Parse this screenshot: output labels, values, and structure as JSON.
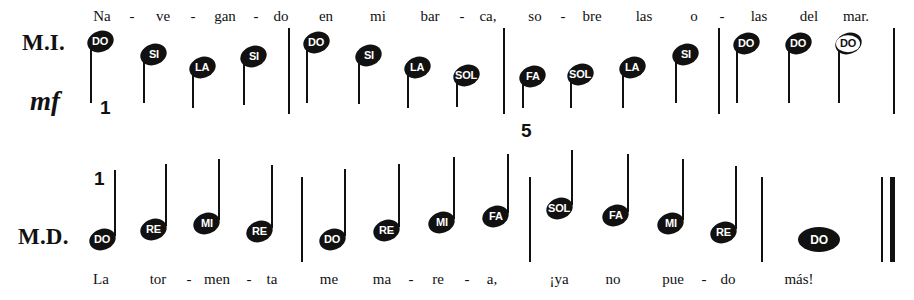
{
  "document": {
    "kind": "music-notation-exercise",
    "language": "es"
  },
  "staves": [
    {
      "id": "upper",
      "hand_label": "M.I.",
      "dynamic": "mf",
      "measure_numbers": [
        {
          "text": "1",
          "x": 100,
          "y": 97
        },
        {
          "text": "5",
          "x": 521,
          "y": 120
        }
      ],
      "lyrics": [
        {
          "text": "Na",
          "x": 102,
          "y": 8
        },
        {
          "text": "-",
          "x": 132,
          "y": 8,
          "hyphen": true
        },
        {
          "text": "ve",
          "x": 163,
          "y": 8
        },
        {
          "text": "-",
          "x": 193,
          "y": 8,
          "hyphen": true
        },
        {
          "text": "gan",
          "x": 225,
          "y": 8
        },
        {
          "text": "-",
          "x": 256,
          "y": 8,
          "hyphen": true
        },
        {
          "text": "do",
          "x": 281,
          "y": 8
        },
        {
          "text": "en",
          "x": 326,
          "y": 8
        },
        {
          "text": "mi",
          "x": 378,
          "y": 8
        },
        {
          "text": "bar",
          "x": 430,
          "y": 8
        },
        {
          "text": "-",
          "x": 462,
          "y": 8,
          "hyphen": true
        },
        {
          "text": "ca,",
          "x": 488,
          "y": 8
        },
        {
          "text": "so",
          "x": 535,
          "y": 8
        },
        {
          "text": "-",
          "x": 563,
          "y": 8,
          "hyphen": true
        },
        {
          "text": "bre",
          "x": 592,
          "y": 8
        },
        {
          "text": "las",
          "x": 644,
          "y": 8
        },
        {
          "text": "o",
          "x": 694,
          "y": 8
        },
        {
          "text": "-",
          "x": 722,
          "y": 8,
          "hyphen": true
        },
        {
          "text": "las",
          "x": 759,
          "y": 8
        },
        {
          "text": "del",
          "x": 809,
          "y": 8
        },
        {
          "text": "mar.",
          "x": 856,
          "y": 8
        }
      ],
      "barlines": [
        {
          "x": 288,
          "y": 28,
          "height": 86,
          "weight": "thin"
        },
        {
          "x": 503,
          "y": 28,
          "height": 86,
          "weight": "thin"
        },
        {
          "x": 718,
          "y": 28,
          "height": 86,
          "weight": "thin"
        },
        {
          "x": 893,
          "y": 28,
          "height": 86,
          "weight": "thin"
        }
      ],
      "notes": [
        {
          "label": "DO",
          "x": 90,
          "y": 42,
          "stem": "down",
          "stem_len": 63,
          "head": "oval"
        },
        {
          "label": "SI",
          "x": 143,
          "y": 55,
          "stem": "down",
          "stem_len": 50,
          "head": "oval"
        },
        {
          "label": "LA",
          "x": 192,
          "y": 68,
          "stem": "down",
          "stem_len": 42,
          "head": "oval"
        },
        {
          "label": "SI",
          "x": 243,
          "y": 57,
          "stem": "down",
          "stem_len": 50,
          "head": "oval"
        },
        {
          "label": "DO",
          "x": 306,
          "y": 43,
          "stem": "down",
          "stem_len": 62,
          "head": "oval"
        },
        {
          "label": "SI",
          "x": 358,
          "y": 56,
          "stem": "down",
          "stem_len": 50,
          "head": "oval"
        },
        {
          "label": "LA",
          "x": 407,
          "y": 68,
          "stem": "down",
          "stem_len": 42,
          "head": "oval"
        },
        {
          "label": "SOL",
          "x": 456,
          "y": 76,
          "stem": "down",
          "stem_len": 33,
          "head": "oval"
        },
        {
          "label": "FA",
          "x": 522,
          "y": 77,
          "stem": "down",
          "stem_len": 33,
          "head": "oval"
        },
        {
          "label": "SOL",
          "x": 570,
          "y": 75,
          "stem": "down",
          "stem_len": 35,
          "head": "oval"
        },
        {
          "label": "LA",
          "x": 622,
          "y": 68,
          "stem": "down",
          "stem_len": 42,
          "head": "oval"
        },
        {
          "label": "SI",
          "x": 675,
          "y": 55,
          "stem": "down",
          "stem_len": 50,
          "head": "oval"
        },
        {
          "label": "DO",
          "x": 736,
          "y": 44,
          "stem": "down",
          "stem_len": 61,
          "head": "oval"
        },
        {
          "label": "DO",
          "x": 788,
          "y": 44,
          "stem": "down",
          "stem_len": 61,
          "head": "oval"
        },
        {
          "label": "DO",
          "x": 838,
          "y": 44,
          "stem": "down",
          "stem_len": 61,
          "head": "oval",
          "style": "hole"
        }
      ]
    },
    {
      "id": "lower",
      "hand_label": "M.D.",
      "dynamic": "",
      "measure_numbers": [
        {
          "text": "1",
          "x": 94,
          "y": 168
        }
      ],
      "lyrics": [
        {
          "text": "La",
          "x": 101,
          "y": 271
        },
        {
          "text": "tor",
          "x": 158,
          "y": 271
        },
        {
          "text": "-",
          "x": 189,
          "y": 271,
          "hyphen": true
        },
        {
          "text": "men",
          "x": 217,
          "y": 271
        },
        {
          "text": "-",
          "x": 249,
          "y": 271,
          "hyphen": true
        },
        {
          "text": "ta",
          "x": 272,
          "y": 271
        },
        {
          "text": "me",
          "x": 329,
          "y": 271
        },
        {
          "text": "ma",
          "x": 382,
          "y": 271
        },
        {
          "text": "-",
          "x": 411,
          "y": 271,
          "hyphen": true
        },
        {
          "text": "re",
          "x": 438,
          "y": 271
        },
        {
          "text": "-",
          "x": 467,
          "y": 271,
          "hyphen": true
        },
        {
          "text": "a,",
          "x": 492,
          "y": 271
        },
        {
          "text": "¡ya",
          "x": 559,
          "y": 271
        },
        {
          "text": "no",
          "x": 613,
          "y": 271
        },
        {
          "text": "pue",
          "x": 673,
          "y": 271
        },
        {
          "text": "-",
          "x": 704,
          "y": 271,
          "hyphen": true
        },
        {
          "text": "do",
          "x": 728,
          "y": 271
        },
        {
          "text": "más!",
          "x": 799,
          "y": 271
        }
      ],
      "barlines": [
        {
          "x": 301,
          "y": 177,
          "height": 85,
          "weight": "thin"
        },
        {
          "x": 529,
          "y": 177,
          "height": 85,
          "weight": "thin"
        },
        {
          "x": 761,
          "y": 177,
          "height": 85,
          "weight": "thin"
        },
        {
          "x": 881,
          "y": 177,
          "height": 85,
          "weight": "thin"
        },
        {
          "x": 890,
          "y": 177,
          "height": 85,
          "weight": "thick"
        }
      ],
      "notes": [
        {
          "label": "DO",
          "x": 92,
          "y": 240,
          "stem": "up",
          "stem_len": 66,
          "head": "oval"
        },
        {
          "label": "RE",
          "x": 143,
          "y": 230,
          "stem": "up",
          "stem_len": 62,
          "head": "oval"
        },
        {
          "label": "MI",
          "x": 196,
          "y": 224,
          "stem": "up",
          "stem_len": 61,
          "head": "oval"
        },
        {
          "label": "RE",
          "x": 249,
          "y": 232,
          "stem": "up",
          "stem_len": 63,
          "head": "oval"
        },
        {
          "label": "DO",
          "x": 322,
          "y": 240,
          "stem": "up",
          "stem_len": 67,
          "head": "oval"
        },
        {
          "label": "RE",
          "x": 376,
          "y": 231,
          "stem": "up",
          "stem_len": 63,
          "head": "oval"
        },
        {
          "label": "MI",
          "x": 431,
          "y": 223,
          "stem": "up",
          "stem_len": 62,
          "head": "oval"
        },
        {
          "label": "FA",
          "x": 485,
          "y": 217,
          "stem": "up",
          "stem_len": 59,
          "head": "oval"
        },
        {
          "label": "SOL",
          "x": 549,
          "y": 209,
          "stem": "up",
          "stem_len": 55,
          "head": "oval"
        },
        {
          "label": "FA",
          "x": 605,
          "y": 216,
          "stem": "up",
          "stem_len": 58,
          "head": "oval"
        },
        {
          "label": "MI",
          "x": 660,
          "y": 224,
          "stem": "up",
          "stem_len": 61,
          "head": "oval"
        },
        {
          "label": "RE",
          "x": 713,
          "y": 233,
          "stem": "up",
          "stem_len": 63,
          "head": "oval"
        },
        {
          "label": "DO",
          "x": 818,
          "y": 240,
          "stem": "none",
          "stem_len": 0,
          "head": "wide"
        }
      ]
    }
  ]
}
